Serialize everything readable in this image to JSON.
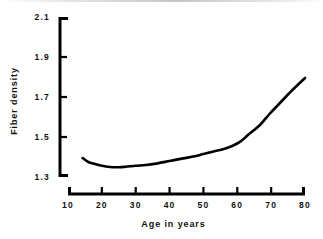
{
  "chart_data": {
    "type": "line",
    "title": "",
    "xlabel": "Age in years",
    "ylabel": "Fiber density",
    "xlim": [
      10,
      80
    ],
    "ylim": [
      1.3,
      2.1
    ],
    "xticks": [
      10,
      20,
      30,
      40,
      50,
      60,
      70,
      80
    ],
    "xtick_labels": [
      "10",
      "20",
      "30",
      "40",
      "50",
      "60",
      "70",
      "80"
    ],
    "yticks": [
      1.3,
      1.5,
      1.7,
      1.9,
      2.1
    ],
    "ytick_labels": [
      "1.3",
      "1.5",
      "1.7",
      "1.9",
      "2.1"
    ],
    "grid": false,
    "legend": false,
    "legend_position": "none",
    "line_color": "#000000",
    "background_color": "#ffffff",
    "series": [
      {
        "name": "Fiber density",
        "x": [
          14.3,
          16.0,
          18.0,
          20.0,
          22.4,
          25.0,
          27.0,
          30.0,
          33.0,
          36.0,
          40.0,
          44.0,
          47.0,
          50.0,
          53.0,
          56.0,
          58.5,
          61.0,
          63.5,
          66.7,
          69.5,
          72.6,
          76.0,
          80.0
        ],
        "y": [
          1.395,
          1.375,
          1.365,
          1.356,
          1.35,
          1.349,
          1.351,
          1.356,
          1.36,
          1.367,
          1.38,
          1.393,
          1.402,
          1.415,
          1.428,
          1.44,
          1.455,
          1.478,
          1.515,
          1.56,
          1.615,
          1.67,
          1.73,
          1.795
        ]
      }
    ]
  },
  "axes": {
    "y_axis_name": "y-axis",
    "x_axis_name": "x-axis"
  }
}
